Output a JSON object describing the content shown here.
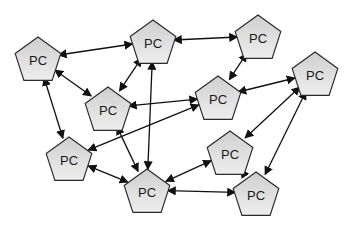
{
  "diagram": {
    "type": "network",
    "node_label": "PC",
    "colors": {
      "node_fill_top": "#d2d2d2",
      "node_fill_bottom": "#ececec",
      "node_stroke": "#2a2a2a",
      "edge": "#111111",
      "background": "#ffffff"
    },
    "nodes": [
      {
        "id": "n1",
        "label": "PC",
        "cx": 38,
        "cy": 58
      },
      {
        "id": "n2",
        "label": "PC",
        "cx": 153,
        "cy": 41
      },
      {
        "id": "n3",
        "label": "PC",
        "cx": 258,
        "cy": 36
      },
      {
        "id": "n4",
        "label": "PC",
        "cx": 108,
        "cy": 108
      },
      {
        "id": "n5",
        "label": "PC",
        "cx": 218,
        "cy": 97
      },
      {
        "id": "n6",
        "label": "PC",
        "cx": 315,
        "cy": 73
      },
      {
        "id": "n7",
        "label": "PC",
        "cx": 69,
        "cy": 158
      },
      {
        "id": "n8",
        "label": "PC",
        "cx": 147,
        "cy": 190
      },
      {
        "id": "n9",
        "label": "PC",
        "cx": 230,
        "cy": 152
      },
      {
        "id": "n10",
        "label": "PC",
        "cx": 256,
        "cy": 193
      }
    ],
    "edges": [
      {
        "from": "n1",
        "to": "n2",
        "bidirectional": true
      },
      {
        "from": "n1",
        "to": "n4",
        "bidirectional": true
      },
      {
        "from": "n1",
        "to": "n7",
        "bidirectional": true
      },
      {
        "from": "n2",
        "to": "n3",
        "bidirectional": true
      },
      {
        "from": "n4",
        "to": "n2",
        "bidirectional": true
      },
      {
        "from": "n4",
        "to": "n5",
        "bidirectional": true
      },
      {
        "from": "n4",
        "to": "n8",
        "bidirectional": true
      },
      {
        "from": "n2",
        "to": "n8",
        "bidirectional": true
      },
      {
        "from": "n3",
        "to": "n5",
        "bidirectional": true
      },
      {
        "from": "n5",
        "to": "n6",
        "bidirectional": true
      },
      {
        "from": "n5",
        "to": "n7",
        "bidirectional": true
      },
      {
        "from": "n6",
        "to": "n9",
        "bidirectional": true
      },
      {
        "from": "n6",
        "to": "n10",
        "bidirectional": true
      },
      {
        "from": "n7",
        "to": "n8",
        "bidirectional": true
      },
      {
        "from": "n8",
        "to": "n9",
        "bidirectional": true
      },
      {
        "from": "n8",
        "to": "n10",
        "bidirectional": true
      },
      {
        "from": "n9",
        "to": "n10",
        "bidirectional": true
      }
    ]
  }
}
